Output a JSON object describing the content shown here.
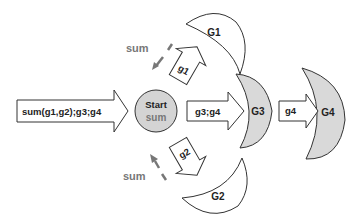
{
  "colors": {
    "stroke": "#333333",
    "fill_white": "#ffffff",
    "fill_gray": "#d9d9d9",
    "start_fill": "#d4d4d4",
    "sum_text": "#777777",
    "label_text": "#222222"
  },
  "input_arrow": {
    "label": "sum(g1,g2);g3;g4"
  },
  "start_node": {
    "title": "Start",
    "subtitle": "sum"
  },
  "arrow_to_g1": {
    "label": "g1"
  },
  "arrow_to_g2": {
    "label": "g2"
  },
  "arrow_to_g3": {
    "label": "g3;g4"
  },
  "arrow_to_g4": {
    "label": "g4"
  },
  "nodes": {
    "g1": {
      "label": "G1"
    },
    "g2": {
      "label": "G2"
    },
    "g3": {
      "label": "G3"
    },
    "g4": {
      "label": "G4"
    }
  },
  "return_g1": {
    "label": "sum"
  },
  "return_g2": {
    "label": "sum"
  }
}
